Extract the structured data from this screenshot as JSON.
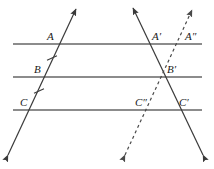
{
  "figure": {
    "kind": "geometry-diagram",
    "width": 214,
    "height": 169,
    "background": "#ffffff"
  },
  "colors": {
    "parallel_line": "#8c8c8c",
    "transversal": "#3a3a3a",
    "dashed_transversal": "#4a4a4a",
    "tick_mark": "#3a3a3a",
    "label_text": "#1a1a1a"
  },
  "parallel_lines": [
    {
      "name": "top-parallel-line",
      "id": "l1",
      "x1": 13,
      "y1": 44,
      "x2": 202,
      "y2": 44,
      "width": 2.2
    },
    {
      "name": "middle-parallel-line",
      "id": "l2",
      "x1": 13,
      "y1": 77,
      "x2": 202,
      "y2": 77,
      "width": 2.2
    },
    {
      "name": "bottom-parallel-line",
      "id": "l3",
      "x1": 13,
      "y1": 110,
      "x2": 202,
      "y2": 110,
      "width": 2.2
    }
  ],
  "transversals": [
    {
      "name": "left-transversal",
      "id": "t1",
      "style": "solid",
      "x1": 8,
      "y1": 155,
      "x2": 76,
      "y2": 9,
      "width": 1.2,
      "arrows": "both"
    },
    {
      "name": "right-transversal",
      "id": "t2",
      "style": "solid",
      "x1": 203,
      "y1": 155,
      "x2": 133,
      "y2": 8,
      "width": 1.2,
      "arrows": "both"
    },
    {
      "name": "dashed-transversal",
      "id": "t3",
      "style": "dashed",
      "x1": 125,
      "y1": 155,
      "x2": 192,
      "y2": 10,
      "width": 1.2,
      "dash": "3 3",
      "arrows": "both"
    }
  ],
  "tick_marks": [
    {
      "name": "tick-segment-AB",
      "cx": 52,
      "cy": 58,
      "angle_deg": -25,
      "length": 11,
      "segment": "AB"
    },
    {
      "name": "tick-segment-BC",
      "cx": 39,
      "cy": 91,
      "angle_deg": -25,
      "length": 11,
      "segment": "BC"
    }
  ],
  "points": [
    {
      "name": "point-label-A",
      "text": "A",
      "x": 47,
      "y": 31
    },
    {
      "name": "point-label-B",
      "text": "B",
      "x": 34,
      "y": 64
    },
    {
      "name": "point-label-C",
      "text": "C",
      "x": 20,
      "y": 97
    },
    {
      "name": "point-label-A-prime",
      "text": "A′",
      "x": 152,
      "y": 31
    },
    {
      "name": "point-label-B-prime",
      "text": "B′",
      "x": 167,
      "y": 64
    },
    {
      "name": "point-label-C-prime",
      "text": "C′",
      "x": 179,
      "y": 97
    },
    {
      "name": "point-label-A-double-prime",
      "text": "A″",
      "x": 185,
      "y": 31
    },
    {
      "name": "point-label-C-double-prime",
      "text": "C″",
      "x": 135,
      "y": 97
    }
  ]
}
